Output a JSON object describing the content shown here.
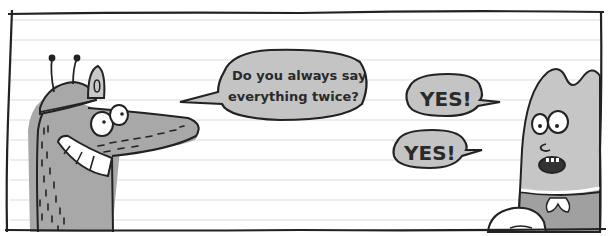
{
  "panel": {
    "paper_color": "#ffffff",
    "rule_color": "#dcdcdc",
    "ink_color": "#222222",
    "rule_lines_y": [
      20,
      40,
      60,
      80,
      100,
      120,
      140,
      160,
      180,
      200,
      220
    ]
  },
  "characters": {
    "left": {
      "description": "grinning grey fox-like creature with antennae cap",
      "body_color": "#a8a8a8"
    },
    "right": {
      "description": "tall grey rounded creature with surprised face",
      "body_color": "#c6c6c6"
    }
  },
  "bubbles": {
    "question": {
      "line1": "Do you always say",
      "line2": "everything twice?",
      "fill": "#c4c4c4"
    },
    "yes_top": {
      "text": "YES!",
      "fill": "#c4c4c4"
    },
    "yes_bottom": {
      "text": "YES!",
      "fill": "#c4c4c4"
    }
  }
}
